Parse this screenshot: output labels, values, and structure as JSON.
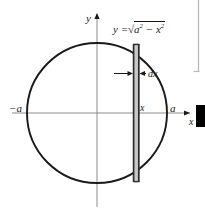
{
  "figure": {
    "type": "geometry-diagram",
    "axes": {
      "y_label": "y",
      "x_label": "x",
      "x_arrow": "right",
      "y_arrow": "up"
    },
    "labels": {
      "neg_a": "−a",
      "pos_a": "a",
      "x_position": "x",
      "strip_width": "dx",
      "equation_lhs": "y =",
      "equation_radicand_a": "a",
      "equation_exp_a": "2",
      "equation_minus": "−",
      "equation_radicand_x": "x",
      "equation_exp_x": "2",
      "radical_sign": "√"
    },
    "colors": {
      "curve": "#1a1a1a",
      "axis": "#8c8c8c",
      "strip_fill": "#c9c9c9",
      "strip_edge": "#2b2b2b",
      "border": "#b9b9b9",
      "marker": "#000000"
    },
    "geometry": {
      "center_x": 97,
      "center_y": 113,
      "radius": 70,
      "strip_left": 133,
      "strip_right": 139
    }
  }
}
